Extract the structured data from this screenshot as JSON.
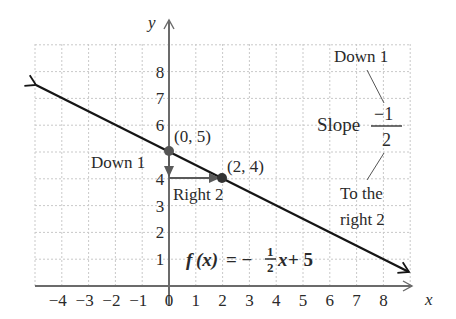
{
  "chart_data": {
    "type": "line",
    "title": "",
    "xlabel": "x",
    "ylabel": "y",
    "xlim": [
      -4.9,
      9.2
    ],
    "ylim": [
      0,
      9
    ],
    "grid": true,
    "x_ticks": [
      "-4",
      "-3",
      "-2",
      "-1",
      "0",
      "1",
      "2",
      "3",
      "4",
      "5",
      "6",
      "7",
      "8"
    ],
    "y_ticks": [
      "1",
      "2",
      "3",
      "4",
      "5",
      "6",
      "7",
      "8"
    ],
    "series": [
      {
        "name": "f(x) = -1/2 x + 5",
        "equation": "f(x) = -(1/2)x + 5",
        "slope": -0.5,
        "intercept": 5,
        "x": [
          -4.9,
          9.0
        ],
        "y": [
          7.45,
          0.5
        ]
      }
    ],
    "points": [
      {
        "label": "(0, 5)",
        "x": 0,
        "y": 5
      },
      {
        "label": "(2, 4)",
        "x": 2,
        "y": 4
      }
    ],
    "annotations": [
      {
        "text": "Down 1",
        "near": "y-axis between (0,5) and (0,4)"
      },
      {
        "text": "Right 2",
        "near": "horizontal arrow from (0,4) to (2,4)"
      },
      {
        "text": "Down 1",
        "near": "slope numerator"
      },
      {
        "text": "Slope",
        "value": "-1/2"
      },
      {
        "text": "To the right 2",
        "near": "slope denominator"
      }
    ]
  },
  "labels": {
    "x_axis": "x",
    "y_axis": "y",
    "point_a": "(0, 5)",
    "point_b": "(2, 4)",
    "down_1_left": "Down 1",
    "right_2": "Right 2",
    "down_1_right": "Down 1",
    "slope_word": "Slope",
    "slope_num": "−1",
    "slope_den": "2",
    "to_the": "To the",
    "right_2b": "right 2",
    "eq_f": "f",
    "eq_x": "(x)",
    "eq_eq": " = −",
    "eq_frac_num": "1",
    "eq_frac_den": "2",
    "eq_tail_x": "x",
    "eq_tail": " + 5"
  },
  "ticks": {
    "x": [
      "−4",
      "−3",
      "−2",
      "−1",
      "0",
      "1",
      "2",
      "3",
      "4",
      "5",
      "6",
      "7",
      "8"
    ],
    "y": [
      "1",
      "2",
      "3",
      "4",
      "5",
      "6",
      "7",
      "8"
    ]
  },
  "colors": {
    "axis": "#6b6b6b",
    "line": "#151515",
    "grid": "#c9c9c9",
    "point": "#555555",
    "step_arrows": "#5a5a5a"
  }
}
